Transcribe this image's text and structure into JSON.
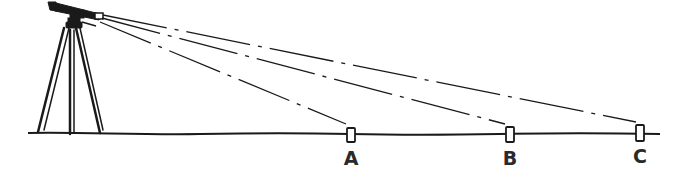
{
  "diagram": {
    "type": "surveying-illustration",
    "instrument": {
      "name": "level-on-tripod",
      "eyepiece": [
        95,
        18
      ]
    },
    "ground": {
      "y": 134,
      "x_start": 28,
      "x_end": 660
    },
    "targets": [
      {
        "id": "A",
        "label": "A",
        "x": 351,
        "rod_top": 127,
        "label_y": 148
      },
      {
        "id": "B",
        "label": "B",
        "x": 510,
        "rod_top": 126,
        "label_y": 148
      },
      {
        "id": "C",
        "label": "C",
        "x": 640,
        "rod_top": 124,
        "label_y": 146
      }
    ],
    "sight_lines": [
      {
        "to": "A",
        "style": "dash-dot"
      },
      {
        "to": "B",
        "style": "dash-dot"
      },
      {
        "to": "C",
        "style": "dash-dot"
      }
    ],
    "colors": {
      "ink": "#1a1a1a",
      "background": "#ffffff"
    }
  }
}
